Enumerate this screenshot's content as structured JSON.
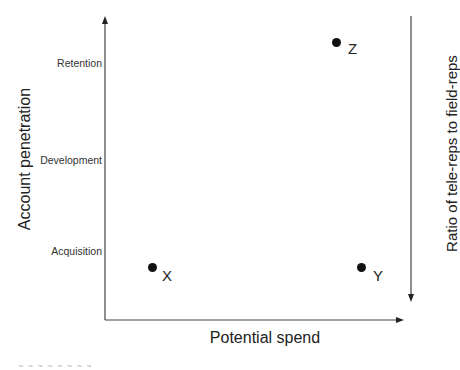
{
  "diagram": {
    "y_axis": {
      "title": "Account penetration",
      "levels": [
        "Retention",
        "Development",
        "Acquisition"
      ]
    },
    "x_axis": {
      "title": "Potential spend"
    },
    "right_axis": {
      "title": "Ratio of tele-reps to field-reps",
      "direction": "down"
    },
    "points": [
      {
        "label": "Z",
        "position": "high penetration, high spend"
      },
      {
        "label": "X",
        "position": "acquisition, low spend"
      },
      {
        "label": "Y",
        "position": "acquisition, high spend"
      }
    ],
    "footer_fragment": "~ ~ ~ ~ ~ ~ ~ ~"
  },
  "colors": {
    "axis": "#333333",
    "point": "#111111",
    "background": "#ffffff"
  }
}
